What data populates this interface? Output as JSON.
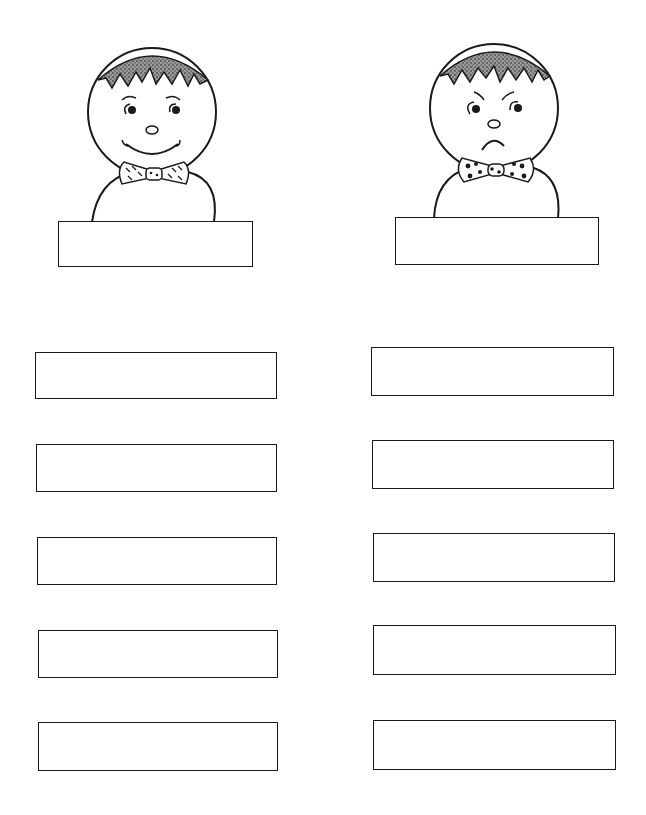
{
  "worksheet": {
    "figures": [
      {
        "id": "happy-boy",
        "expression": "happy",
        "bowtie_pattern": "dashed",
        "label_box": {
          "value": ""
        }
      },
      {
        "id": "sad-boy",
        "expression": "sad",
        "bowtie_pattern": "polka-dot",
        "label_box": {
          "value": ""
        }
      }
    ],
    "columns": [
      {
        "side": "left",
        "boxes": [
          {
            "value": ""
          },
          {
            "value": ""
          },
          {
            "value": ""
          },
          {
            "value": ""
          },
          {
            "value": ""
          }
        ]
      },
      {
        "side": "right",
        "boxes": [
          {
            "value": ""
          },
          {
            "value": ""
          },
          {
            "value": ""
          },
          {
            "value": ""
          },
          {
            "value": ""
          }
        ]
      }
    ],
    "colors": {
      "ink": "#1a1a1a",
      "paper": "#ffffff",
      "hair": "#555555"
    }
  }
}
